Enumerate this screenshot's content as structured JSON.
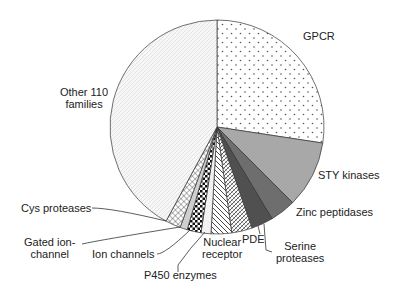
{
  "chart_data": {
    "type": "pie",
    "title": "",
    "start_angle_deg": 0,
    "direction": "clockwise",
    "categories": [
      "GPCR",
      "STY kinases",
      "Zinc peptidases",
      "Serine proteases",
      "PDE",
      "Nuclear receptor",
      "P450 enzymes",
      "Ion channels",
      "Gated ion-channel",
      "Cys proteases",
      "Other 110 families"
    ],
    "values": [
      27.4,
      10.1,
      3.9,
      3.3,
      3.1,
      3.1,
      1.5,
      2.1,
      1.1,
      2.3,
      42.1
    ],
    "unit": "%",
    "fills": [
      {
        "pattern": "dots",
        "color": "#ffffff",
        "ink": "#555555"
      },
      {
        "pattern": "solid",
        "color": "#a8a8a8"
      },
      {
        "pattern": "solid",
        "color": "#6e6e6e"
      },
      {
        "pattern": "solid",
        "color": "#505050"
      },
      {
        "pattern": "crosshatch-diag",
        "color": "#ffffff",
        "ink": "#333333"
      },
      {
        "pattern": "diag-stripes",
        "color": "#ffffff",
        "ink": "#333333"
      },
      {
        "pattern": "solid",
        "color": "#f2f2f2"
      },
      {
        "pattern": "checker",
        "color": "#ffffff",
        "ink": "#111111"
      },
      {
        "pattern": "solid",
        "color": "#cfcfcf"
      },
      {
        "pattern": "grid-diag",
        "color": "#ffffff",
        "ink": "#444444"
      },
      {
        "pattern": "fine-diag-dots",
        "color": "#f7f7f7",
        "ink": "#9a9a9a"
      }
    ],
    "legend": "none (direct labels)"
  },
  "labels": {
    "gpcr": "GPCR",
    "sty": "STY kinases",
    "zinc": "Zinc peptidases",
    "serine_1": "Serine",
    "serine_2": "proteases",
    "pde": "PDE",
    "nuclear_1": "Nuclear",
    "nuclear_2": "receptor",
    "p450": "P450 enzymes",
    "ion": "Ion channels",
    "gated_1": "Gated ion-",
    "gated_2": "channel",
    "cys": "Cys proteases",
    "other_1": "Other 110",
    "other_2": "families"
  }
}
